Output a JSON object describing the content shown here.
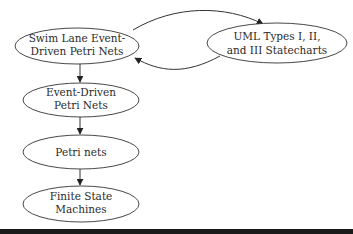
{
  "diagram": {
    "nodes": [
      {
        "id": "swim-lane",
        "lines": [
          "Swim Lane Event-",
          "Driven Petri Nets"
        ]
      },
      {
        "id": "uml",
        "lines": [
          "UML Types I, II,",
          "and III Statecharts"
        ]
      },
      {
        "id": "event-driven",
        "lines": [
          "Event-Driven",
          "Petri Nets"
        ]
      },
      {
        "id": "petri",
        "lines": [
          "Petri nets"
        ]
      },
      {
        "id": "fsm",
        "lines": [
          "Finite State",
          "Machines"
        ]
      }
    ],
    "edges": [
      {
        "from": "swim-lane",
        "to": "uml"
      },
      {
        "from": "uml",
        "to": "swim-lane"
      },
      {
        "from": "swim-lane",
        "to": "event-driven"
      },
      {
        "from": "event-driven",
        "to": "petri"
      },
      {
        "from": "petri",
        "to": "fsm"
      }
    ],
    "colors": {
      "stroke": "#333333",
      "text": "#2a2a2a",
      "rule": "#1a1a1a"
    }
  }
}
